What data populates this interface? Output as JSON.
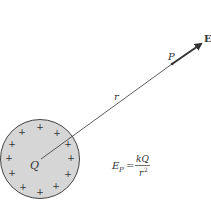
{
  "diagram": {
    "charge_label": "Q",
    "plus_sign": "+",
    "distance_label": "r",
    "point_label": "P",
    "field_label": "E",
    "formula": {
      "lhs": "E",
      "lhs_subscript": "P",
      "equals": "=",
      "numerator": "kQ",
      "denominator": "r",
      "denominator_exponent": "2"
    },
    "colors": {
      "sphere_fill": "#d6d6d6",
      "sphere_stroke": "#444444",
      "line": "#333333",
      "arrow": "#333333"
    }
  }
}
